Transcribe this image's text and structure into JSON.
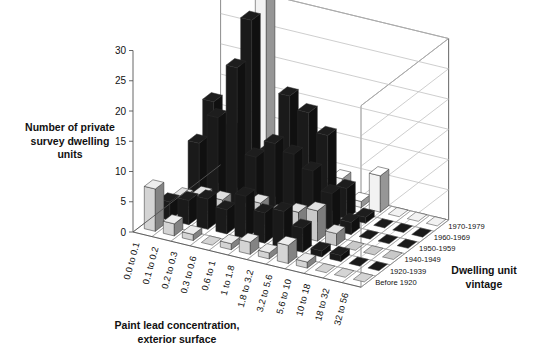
{
  "chart_data": {
    "type": "bar",
    "title": "",
    "subtitle": "",
    "xlabel": "Paint lead concentration, exterior surface",
    "ylabel": "Number of private survey dwelling units",
    "zlabel": "Dwelling unit vintage",
    "ylim": [
      0,
      30
    ],
    "yticks": [
      0,
      5,
      10,
      15,
      20,
      25,
      30
    ],
    "grid": true,
    "legend_position": "none",
    "projection": "3d-bar",
    "categories": [
      "0.0 to 0.1",
      "0.1 to 0.2",
      "0.2 to 0.3",
      "0.3 to 0.6",
      "0.6 to 1",
      "1 to 1.8",
      "1.8 to 3.2",
      "3.2 to 5.6",
      "5.6 to 10",
      "10 to 18",
      "18 to 32",
      "32 to 56"
    ],
    "depth_categories": [
      "Before 1920",
      "1920-1939",
      "1940-1949",
      "1950-1959",
      "1960-1969",
      "1970-1979"
    ],
    "series": [
      {
        "name": "Before 1920",
        "color": "#d4d4d4",
        "values": [
          7,
          2,
          1,
          0,
          1,
          2,
          1,
          3,
          1,
          0,
          0,
          0
        ]
      },
      {
        "name": "1920-1939",
        "color": "#1a1a1a",
        "values": [
          3,
          4,
          5,
          4,
          7,
          5,
          6,
          4,
          1,
          1,
          0,
          0
        ]
      },
      {
        "name": "1940-1949",
        "color": "#c9c9c9",
        "values": [
          2,
          3,
          3,
          2,
          4,
          3,
          4,
          5,
          2,
          0,
          0,
          0
        ]
      },
      {
        "name": "1950-1959",
        "color": "#1a1a1a",
        "values": [
          9,
          14,
          23,
          9,
          12,
          11,
          9,
          6,
          2,
          0,
          0,
          0
        ]
      },
      {
        "name": "1960-1969",
        "color": "#1a1a1a",
        "values": [
          14,
          10,
          29,
          8,
          18,
          16,
          13,
          5,
          1,
          0,
          0,
          0
        ]
      },
      {
        "name": "1970-1979",
        "color": "#f2f2f2",
        "values": [
          2,
          1,
          31,
          2,
          3,
          2,
          4,
          1,
          6,
          0,
          0,
          0
        ]
      }
    ]
  }
}
